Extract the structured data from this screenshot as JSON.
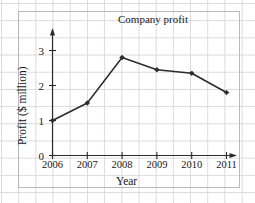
{
  "chart_data": {
    "type": "line",
    "title": "Company profit",
    "xlabel": "Year",
    "ylabel": "Profit ($ million)",
    "categories": [
      "2006",
      "2007",
      "2008",
      "2009",
      "2010",
      "2011"
    ],
    "x": [
      2006,
      2007,
      2008,
      2009,
      2010,
      2011
    ],
    "values": [
      1.0,
      1.5,
      2.8,
      2.45,
      2.35,
      1.8
    ],
    "series": [
      {
        "name": "Company profit",
        "values": [
          1.0,
          1.5,
          2.8,
          2.45,
          2.35,
          1.8
        ]
      }
    ],
    "ylim": [
      0,
      3.4
    ],
    "xlim": [
      2006,
      2011.5
    ],
    "y_ticks": [
      0,
      1,
      2,
      3
    ],
    "y_tick_labels": [
      "0",
      "1",
      "2",
      "3"
    ],
    "x_ticks": [
      2006,
      2007,
      2008,
      2009,
      2010,
      2011
    ],
    "x_tick_labels": [
      "2006",
      "2007",
      "2008",
      "2009",
      "2010",
      "2011"
    ],
    "grid": true,
    "legend": false,
    "legend_position": "none",
    "marker": "diamond",
    "line_color": "#2b2b2b",
    "grid_color": "#d9d9e0",
    "axis_color": "#2b2b2b",
    "background_color": "#ffffff",
    "annotations": []
  }
}
